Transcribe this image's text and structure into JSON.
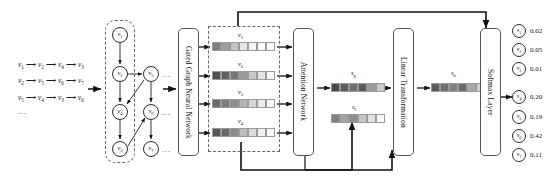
{
  "diagram": {
    "input_sequences": {
      "rows": [
        {
          "items": [
            "v1",
            "v2",
            "v4",
            "v3"
          ]
        },
        {
          "items": [
            "v2",
            "v5",
            "v6",
            "v7"
          ]
        },
        {
          "items": [
            "v5",
            "v4",
            "v3",
            "v6"
          ]
        }
      ],
      "ellipsis": "..."
    },
    "session_graph": {
      "left_nodes": [
        {
          "id": "v1",
          "label": "v",
          "sub": "1",
          "x": 112,
          "y": 27
        },
        {
          "id": "v2",
          "label": "v",
          "sub": "2",
          "x": 112,
          "y": 66
        },
        {
          "id": "v4",
          "label": "v",
          "sub": "4",
          "x": 112,
          "y": 104
        },
        {
          "id": "v3",
          "label": "v",
          "sub": "3",
          "x": 112,
          "y": 141
        }
      ],
      "right_nodes": [
        {
          "id": "v5",
          "label": "v",
          "sub": "5",
          "x": 143,
          "y": 66
        },
        {
          "id": "v6",
          "label": "v",
          "sub": "6",
          "x": 143,
          "y": 104
        },
        {
          "id": "v7",
          "label": "v",
          "sub": "7",
          "x": 143,
          "y": 141
        }
      ],
      "row_ellipsis": [
        "...",
        "...",
        "..."
      ]
    },
    "blocks": {
      "ggnn": "Gated Graph Neural Network",
      "attention": "Attention Network",
      "linear": "Linear Transformation",
      "softmax": "Softmax Layer"
    },
    "embeddings": {
      "label_prefix": "v",
      "vectors": [
        {
          "label": "v",
          "sub": "1",
          "cells": [
            "#808080",
            "#9e9e9e",
            "#c4c4c4",
            "#e8e8e8",
            "#f4f4f4",
            "#fbfbfb",
            "#ffffff"
          ]
        },
        {
          "label": "v",
          "sub": "2",
          "cells": [
            "#4f4f4f",
            "#5f5f5f",
            "#767676",
            "#9c9c9c",
            "#c9c9c9",
            "#e4e4e4",
            "#f7f7f7"
          ]
        },
        {
          "label": "v",
          "sub": "3",
          "cells": [
            "#6a6a6a",
            "#7d7d7d",
            "#8d8d8d",
            "#b4b4b4",
            "#d6d6d6",
            "#ececec",
            "#fafafa"
          ]
        },
        {
          "label": "v",
          "sub": "4",
          "cells": [
            "#575757",
            "#6b6b6b",
            "#8a8a8a",
            "#bdbdbd",
            "#dcdcdc",
            "#f0f0f0",
            "#fcfcfc"
          ]
        }
      ]
    },
    "session_vectors": [
      {
        "name": "s",
        "sub": "g",
        "cells": [
          "#4a4a4a",
          "#5c5c5c",
          "#6e6e6e",
          "#5a5a5a",
          "#9b9b9b",
          "#c9c9c9"
        ]
      },
      {
        "name": "s",
        "sub": "l",
        "cells": [
          "#808080",
          "#a4a4a4",
          "#8f8f8f",
          "#c6c6c6",
          "#e2e2e2",
          "#f7f7f7"
        ]
      },
      {
        "name": "s",
        "sub": "h",
        "cells": [
          "#5a5a5a",
          "#6d6d6d",
          "#808080",
          "#6b6b6b",
          "#a9a9a9",
          "#d2d2d2"
        ]
      }
    ],
    "outputs": [
      {
        "label": "v",
        "sub": "1",
        "value": "0.02",
        "highlighted": false
      },
      {
        "label": "v",
        "sub": "2",
        "value": "0.05",
        "highlighted": false
      },
      {
        "label": "v",
        "sub": "3",
        "value": "0.01",
        "highlighted": false
      },
      {
        "label": "v",
        "sub": "4",
        "value": "0.20",
        "highlighted": true
      },
      {
        "label": "v",
        "sub": "5",
        "value": "0.19",
        "highlighted": false
      },
      {
        "label": "v",
        "sub": "6",
        "value": "0.42",
        "highlighted": false
      },
      {
        "label": "v",
        "sub": "7",
        "value": "0.11",
        "highlighted": false
      }
    ],
    "colors": {
      "stroke": "#2b2b2b",
      "dashed": "#666666",
      "box_border": "#555555",
      "background": "#ffffff"
    }
  }
}
